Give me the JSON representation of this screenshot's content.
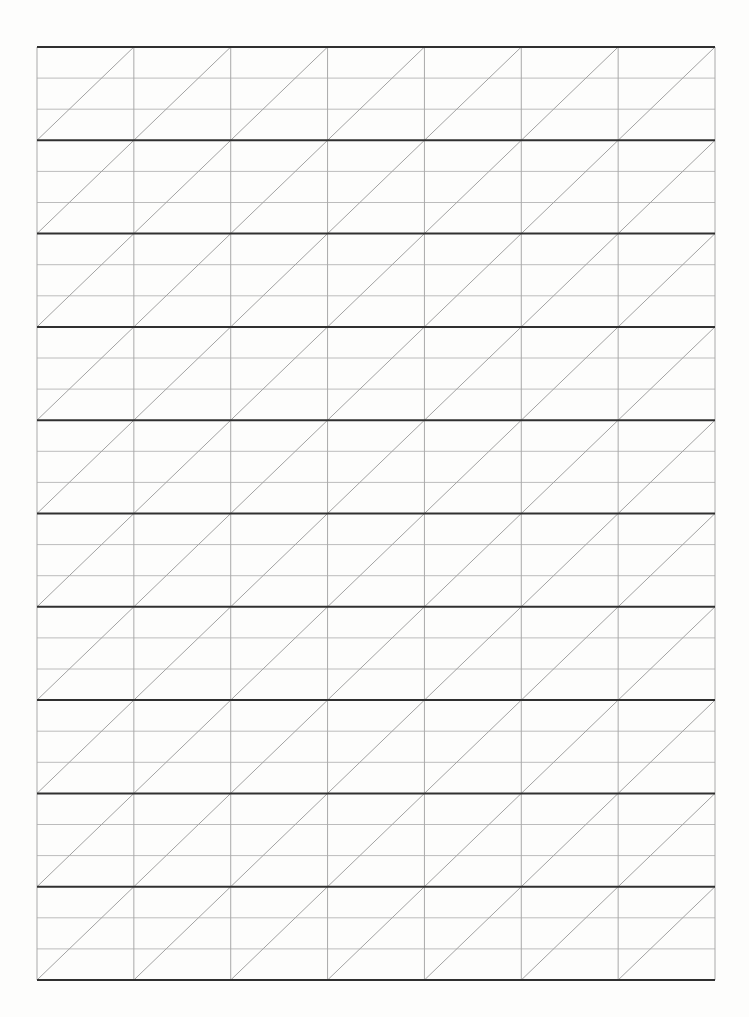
{
  "page": {
    "width": 749,
    "height": 1017,
    "background": "#fdfdfc",
    "kind": "blank calligraphy slant-grid practice sheet (scan)"
  },
  "grid": {
    "left": 37,
    "top": 47,
    "right": 715,
    "bottom": 980,
    "columns": 7,
    "rows": 10,
    "subdivisions_per_row": 3,
    "diagonal_direction": "bottom-left-to-top-right",
    "diagonal_count": 16,
    "colors": {
      "paper": "#fdfdfc",
      "block_line": "#303030",
      "thin_line": "#bcbcbc",
      "vertical_line": "#a9a9a9",
      "diagonal_line": "#a2a2a2"
    },
    "stroke_widths": {
      "block_line": 2,
      "thin_line": 1,
      "vertical_line": 1,
      "diagonal_line": 1
    }
  }
}
